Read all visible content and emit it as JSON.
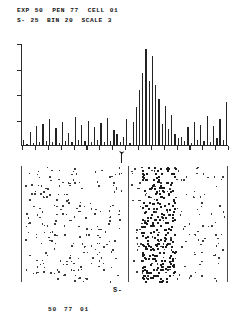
{
  "header": {
    "line1": {
      "exp_label": "EXP",
      "exp_value": "50",
      "pen_label": "PEN",
      "pen_value": "77",
      "cell_label": "CELL",
      "cell_value": "01"
    },
    "line2": {
      "s_label": "S-",
      "s_value": "25",
      "bin_label": "BIN",
      "bin_value": "20",
      "scale_label": "SCALE",
      "scale_value": "3"
    }
  },
  "footer": {
    "exp": "50",
    "pen": "77",
    "cell": "01"
  },
  "stimulus": {
    "marker_label": "S-",
    "arrow_icon": "up-arrow-icon"
  },
  "chart_data": {
    "type": "bar",
    "title": "",
    "xlabel": "",
    "ylabel": "",
    "ylim": [
      0,
      100
    ],
    "n_bins": 64,
    "bin_width_label": "BIN 20",
    "scale_label": "SCALE 3",
    "stimulus_bin": 33,
    "y_ticks": [
      0,
      25,
      50,
      75,
      100
    ],
    "values": [
      6,
      2,
      14,
      3,
      20,
      4,
      22,
      5,
      26,
      4,
      18,
      3,
      24,
      5,
      13,
      4,
      28,
      6,
      21,
      5,
      25,
      4,
      19,
      6,
      23,
      4,
      27,
      5,
      16,
      12,
      4,
      9,
      26,
      3,
      24,
      38,
      55,
      72,
      95,
      64,
      88,
      60,
      46,
      22,
      39,
      17,
      30,
      12,
      8,
      9,
      5,
      19,
      3,
      24,
      6,
      21,
      5,
      29,
      4,
      20,
      8,
      26,
      6,
      43
    ],
    "categories": [
      "1",
      "2",
      "3",
      "4",
      "5",
      "6",
      "7",
      "8",
      "9",
      "10",
      "11",
      "12",
      "13",
      "14",
      "15",
      "16",
      "17",
      "18",
      "19",
      "20",
      "21",
      "22",
      "23",
      "24",
      "25",
      "26",
      "27",
      "28",
      "29",
      "30",
      "31",
      "32",
      "33",
      "34",
      "35",
      "36",
      "37",
      "38",
      "39",
      "40",
      "41",
      "42",
      "43",
      "44",
      "45",
      "46",
      "47",
      "48",
      "49",
      "50",
      "51",
      "52",
      "53",
      "54",
      "55",
      "56",
      "57",
      "58",
      "59",
      "60",
      "61",
      "62",
      "63",
      "64"
    ],
    "grid": false,
    "legend": "none"
  },
  "rasters": {
    "left_panel": {
      "name": "pre-stimulus-raster",
      "n_trials": 40,
      "density": "sparse"
    },
    "right_panel": {
      "name": "post-stimulus-raster",
      "n_trials": 40,
      "density": "banded",
      "response_band_present": true
    }
  }
}
